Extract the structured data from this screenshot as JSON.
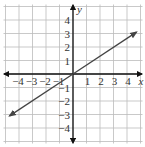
{
  "chart_data": {
    "type": "line",
    "title": "",
    "xlabel": "x",
    "ylabel": "y",
    "xlim": [
      -5,
      5
    ],
    "ylim": [
      -5,
      5
    ],
    "grid": true,
    "x_ticks": [
      "-4",
      "-3",
      "-2",
      "-1",
      "1",
      "2",
      "3",
      "4"
    ],
    "y_ticks": [
      "4",
      "3",
      "2",
      "1",
      "-1",
      "-2",
      "-3",
      "-4"
    ],
    "series": [
      {
        "name": "y = (2/3)x",
        "equation": "y = 2/3 x",
        "x": [
          -4.7,
          0,
          4.7
        ],
        "y": [
          -3.1,
          0,
          3.1
        ],
        "arrows": "both",
        "color": "#444444"
      }
    ]
  },
  "colors": {
    "grid": "#bbbbbb",
    "axis": "#111111",
    "line": "#444444"
  }
}
